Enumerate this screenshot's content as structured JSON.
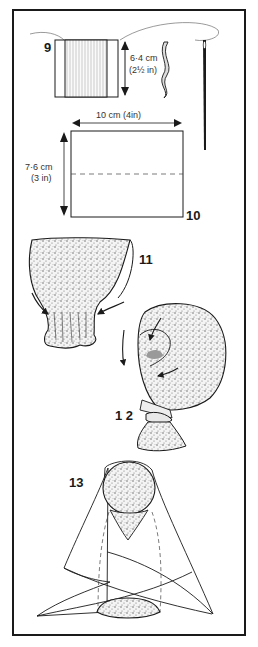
{
  "illustration": {
    "steps": [
      {
        "number": "9",
        "label": "9"
      },
      {
        "number": "10",
        "label": "10"
      },
      {
        "number": "11",
        "label": "11"
      },
      {
        "number": "12",
        "label": "1 2"
      },
      {
        "number": "13",
        "label": "13"
      }
    ],
    "measurements": {
      "spool_height_cm": "6·4 cm",
      "spool_height_in": "(2½ in)",
      "rect_width": "10 cm  (4in)",
      "rect_height_cm": "7·6 cm",
      "rect_height_in": "(3 in)"
    },
    "colors": {
      "ink": "#1a1a1a",
      "paper": "#ffffff",
      "stipple": "#bdbdbd",
      "face_patch": "#9a9a9a"
    }
  }
}
